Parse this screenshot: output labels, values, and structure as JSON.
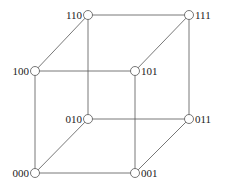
{
  "diagram": {
    "nodes": [
      {
        "id": "000",
        "label": "000",
        "x": 35,
        "y": 173,
        "label_side": "left"
      },
      {
        "id": "001",
        "label": "001",
        "x": 135,
        "y": 173,
        "label_side": "right"
      },
      {
        "id": "010",
        "label": "010",
        "x": 88,
        "y": 119,
        "label_side": "left"
      },
      {
        "id": "011",
        "label": "011",
        "x": 189,
        "y": 119,
        "label_side": "right"
      },
      {
        "id": "100",
        "label": "100",
        "x": 35,
        "y": 71,
        "label_side": "left"
      },
      {
        "id": "101",
        "label": "101",
        "x": 135,
        "y": 71,
        "label_side": "right"
      },
      {
        "id": "110",
        "label": "110",
        "x": 88,
        "y": 15,
        "label_side": "left"
      },
      {
        "id": "111",
        "label": "111",
        "x": 189,
        "y": 15,
        "label_side": "right"
      }
    ],
    "edges": [
      [
        "000",
        "001"
      ],
      [
        "000",
        "010"
      ],
      [
        "000",
        "100"
      ],
      [
        "001",
        "011"
      ],
      [
        "001",
        "101"
      ],
      [
        "010",
        "011"
      ],
      [
        "010",
        "110"
      ],
      [
        "011",
        "111"
      ],
      [
        "100",
        "101"
      ],
      [
        "100",
        "110"
      ],
      [
        "101",
        "111"
      ],
      [
        "110",
        "111"
      ]
    ],
    "colors": {
      "edge": "#555555",
      "node_fill": "#ffffff",
      "text": "#222222"
    }
  }
}
